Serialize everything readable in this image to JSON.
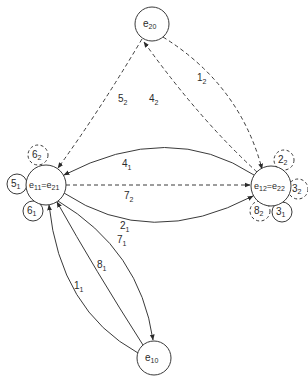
{
  "diagram": {
    "type": "state-transition-graph",
    "nodes": [
      {
        "id": "e20",
        "base": "e",
        "sub": "20",
        "x": 152,
        "y": 24,
        "r": 17
      },
      {
        "id": "e11_e21",
        "base": "e",
        "sub": "11",
        "base2": "=e",
        "sub2": "21",
        "x": 46,
        "y": 185,
        "r": 20
      },
      {
        "id": "e12_e22",
        "base": "e",
        "sub": "12",
        "base2": "=e",
        "sub2": "22",
        "x": 271,
        "y": 186,
        "r": 20
      },
      {
        "id": "e10",
        "base": "e",
        "sub": "10",
        "x": 154,
        "y": 358,
        "r": 17
      }
    ],
    "self_loops": [
      {
        "id": "loop-6-2",
        "base": "6",
        "sub": "2",
        "x": 38,
        "y": 155,
        "r": 10,
        "dashed": true
      },
      {
        "id": "loop-5-1",
        "base": "5",
        "sub": "1",
        "x": 17,
        "y": 184,
        "r": 10,
        "dashed": false
      },
      {
        "id": "loop-6-1",
        "base": "6",
        "sub": "1",
        "x": 33,
        "y": 211,
        "r": 10,
        "dashed": false
      },
      {
        "id": "loop-2-2",
        "base": "2",
        "sub": "2",
        "x": 284,
        "y": 160,
        "r": 10,
        "dashed": true
      },
      {
        "id": "loop-3-2",
        "base": "3",
        "sub": "2",
        "x": 298,
        "y": 189,
        "r": 10,
        "dashed": true
      },
      {
        "id": "loop-3-1",
        "base": "3",
        "sub": "1",
        "x": 282,
        "y": 212,
        "r": 10,
        "dashed": false
      },
      {
        "id": "loop-8-2",
        "base": "8",
        "sub": "2",
        "x": 260,
        "y": 211,
        "r": 10,
        "dashed": true
      }
    ],
    "edges": [
      {
        "id": "edge-5-2",
        "from": "e20",
        "to": "e11_e21",
        "base": "5",
        "sub": "2",
        "dashed": true,
        "lx": 118,
        "ly": 102
      },
      {
        "id": "edge-4-2",
        "from": "e12_e22",
        "to": "e20",
        "base": "4",
        "sub": "2",
        "dashed": true,
        "lx": 149,
        "ly": 102
      },
      {
        "id": "edge-1-2",
        "from": "e20",
        "to": "e12_e22",
        "base": "1",
        "sub": "2",
        "dashed": true,
        "lx": 197,
        "ly": 79
      },
      {
        "id": "edge-4-1",
        "from": "e12_e22",
        "to": "e11_e21",
        "base": "4",
        "sub": "1",
        "dashed": false,
        "lx": 122,
        "ly": 164
      },
      {
        "id": "edge-7-2",
        "from": "e11_e21",
        "to": "e12_e22",
        "base": "7",
        "sub": "2",
        "dashed": true,
        "lx": 124,
        "ly": 197
      },
      {
        "id": "edge-2-1",
        "from": "e11_e21",
        "to": "e12_e22",
        "base": "2",
        "sub": "1",
        "dashed": false,
        "lx": 120,
        "ly": 227
      },
      {
        "id": "edge-7-1",
        "from": "e10",
        "to": "e11_e21",
        "base": "7",
        "sub": "1",
        "dashed": false,
        "lx": 117,
        "ly": 241
      },
      {
        "id": "edge-8-1",
        "from": "e10",
        "to": "e11_e21",
        "base": "8",
        "sub": "1",
        "dashed": false,
        "lx": 97,
        "ly": 267
      },
      {
        "id": "edge-1-1",
        "from": "e10",
        "to": "e11_e21",
        "base": "1",
        "sub": "1",
        "dashed": false,
        "lx": 74,
        "ly": 287
      }
    ],
    "colors": {
      "stroke": "#3a3a3a",
      "text": "#2a2a2a",
      "background": "#ffffff"
    }
  }
}
